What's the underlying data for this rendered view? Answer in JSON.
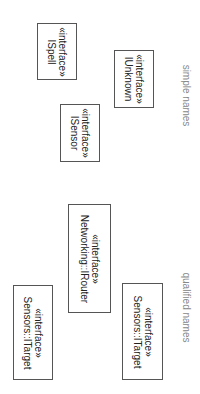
{
  "diagram": {
    "orientation": "rotated 90 degrees clockwise",
    "section_labels": {
      "simple": "simple names",
      "qualified": "qualified names"
    },
    "interfaces": [
      {
        "stereotype": "«interface»",
        "name": "ISpell"
      },
      {
        "stereotype": "«interface»",
        "name": "IUnknown"
      },
      {
        "stereotype": "«interface»",
        "name": "ISensor"
      },
      {
        "stereotype": "«interface»",
        "name": "Networking::IRouter"
      },
      {
        "stereotype": "«interface»",
        "name": "Sensors::ITarget"
      },
      {
        "stereotype": "«interface»",
        "name": "Sensors::ITarget"
      }
    ]
  }
}
